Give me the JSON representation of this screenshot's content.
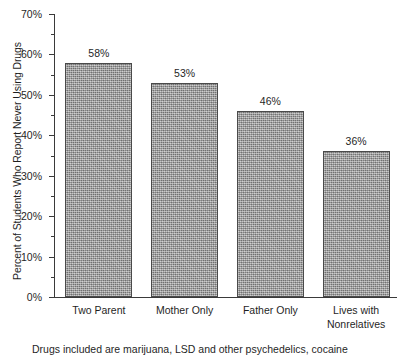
{
  "chart_data": {
    "type": "bar",
    "title": "",
    "subtitle": "",
    "xlabel": "",
    "ylabel": "Percent of Students Who Report Never Using Drugs",
    "categories": [
      "Two Parent",
      "Mother Only",
      "Father Only",
      "Lives with Nonrelatives"
    ],
    "values": [
      58,
      53,
      46,
      36
    ],
    "value_labels": [
      "58%",
      "53%",
      "46%",
      "36%"
    ],
    "ylim": [
      0,
      70
    ],
    "ytick_values": [
      0,
      10,
      20,
      30,
      40,
      50,
      60,
      70
    ],
    "ytick_labels": [
      "0%",
      "10%",
      "20%",
      "30%",
      "40%",
      "50%",
      "60%",
      "70%"
    ],
    "yminor_tick_values": [
      5,
      15,
      25,
      35,
      45,
      55,
      65
    ],
    "grid": false,
    "legend": false,
    "bar_color": "#9a9a9a",
    "bar_edge_color": "#4a4a4a",
    "axis_color": "#3a3a3a"
  },
  "caption": {
    "text": "Drugs included are marijuana, LSD and other psychedelics, cocaine"
  }
}
